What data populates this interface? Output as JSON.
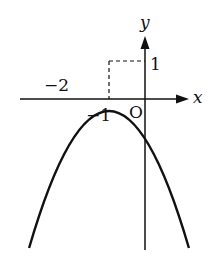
{
  "diagram": {
    "type": "function-graph",
    "function": "y = -x^2 - 2x",
    "vertex": [
      -1,
      1
    ],
    "roots": [
      -2,
      0
    ],
    "axes": {
      "x_label": "x",
      "y_label": "y",
      "origin_label": "O"
    },
    "tick_labels": {
      "neg_two": "−2",
      "neg_one": "−1",
      "one": "1"
    },
    "colors": {
      "curve": "#111111",
      "axis": "#111111",
      "background": "#ffffff"
    }
  }
}
